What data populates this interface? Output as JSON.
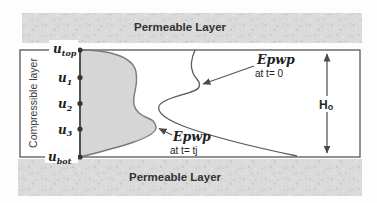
{
  "layers": {
    "top_label": "Permeable Layer",
    "bottom_label": "Permeable Layer",
    "middle_label": "Compressible layer"
  },
  "nodes": {
    "u_top": {
      "base": "u",
      "sub": "top"
    },
    "u_1": {
      "base": "u",
      "sub": "1"
    },
    "u_2": {
      "base": "u",
      "sub": "2"
    },
    "u_3": {
      "base": "u",
      "sub": "3"
    },
    "u_bot": {
      "base": "u",
      "sub": "bot"
    }
  },
  "annotations": {
    "epwp_t0_line1": "Epwp",
    "epwp_t0_line2": "at t= 0",
    "epwp_tj_line1": "Epwp",
    "epwp_tj_line2": "at t= tj",
    "height": {
      "base": "H",
      "sub": "o"
    }
  },
  "curves": {
    "epwp_tj_path": "M 80,50 C 108,50 133,56 136,72 C 138,84 135,88 134,97 C 133,104 134,108 139,113 C 147,120 154,117 156,127 C 158,138 112,149 80,157 Z",
    "epwp_t0_path": "M 195,50 C 191,59 190,66 193,73 C 196,80 201,81 199,87 C 197,93 174,95 163,102 C 153,108 160,117 183,126 C 220,140 268,150 297,156"
  },
  "colors": {
    "speckle_base": "#dadada",
    "shade_fill": "#d6d6d6",
    "shade_stroke": "#7a7a7a",
    "curve_stroke": "#5a5a5a",
    "line": "#3f3f3f",
    "box_stroke": "#4a4a4a",
    "text": "#1e1e1e"
  }
}
